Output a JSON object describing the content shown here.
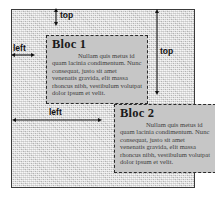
{
  "diagram": {
    "container": {
      "name": "page-container",
      "background_color": "#d8d8d8",
      "border_color": "#3a3a3a"
    },
    "blocks": [
      {
        "id": "bloc1",
        "title": "Bloc 1",
        "body": "Nullam quis metus id quam lacinia condimentum. Nunc consequat, justo sit amet venenatis gravida, elit massa rhoncus nibh, vestibulum volutpat dolor ipsum et velit.",
        "background_color": "#c6c6c6",
        "border_color": "#2b2b2b",
        "border_style": "dashed"
      },
      {
        "id": "bloc2",
        "title": "Bloc 2",
        "body": "Nullam quis metus id quam lacinia condimentum. Nunc consequat, justo sit amet venenatis gravida, elit massa rhoncus nibh, vestibulum volutpat dolor ipsum et velit.",
        "background_color": "#c6c6c6",
        "border_color": "#2b2b2b",
        "border_style": "dashed"
      }
    ],
    "measurements": [
      {
        "id": "top-bloc1",
        "label": "top",
        "orientation": "vertical",
        "describes": "offset from container top edge to Bloc 1 top edge"
      },
      {
        "id": "left-bloc1",
        "label": "left",
        "orientation": "horizontal",
        "describes": "offset from container left edge to Bloc 1 left edge"
      },
      {
        "id": "top-bloc2",
        "label": "top",
        "orientation": "vertical",
        "describes": "offset from container top edge to Bloc 2 top edge"
      },
      {
        "id": "left-bloc2",
        "label": "left",
        "orientation": "horizontal",
        "describes": "offset from container left edge to Bloc 2 left edge"
      }
    ],
    "colors": {
      "line": "#111111",
      "block_fill": "#c6c6c6",
      "container_fill": "#d8d8d8",
      "border": "#3a3a3a"
    }
  }
}
